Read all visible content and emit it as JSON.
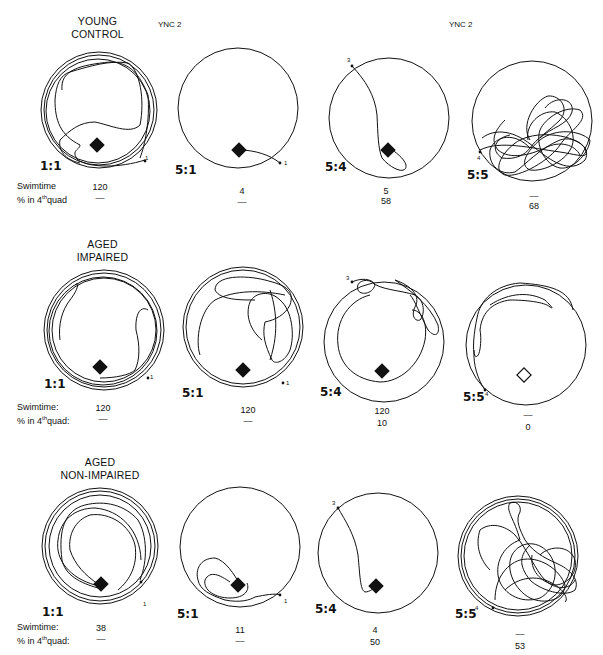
{
  "header": {
    "session_label_left": "YNC 2",
    "session_label_right": "YNC 2"
  },
  "row_labels": {
    "swimtime": "Swimtime",
    "quad": "% in 4th quad",
    "quad_prefix": "% in 4",
    "quad_sup": "th",
    "quad_suffix": "quad",
    "colon": ":"
  },
  "groups": [
    {
      "title_line1": "YOUNG",
      "title_line2": "CONTROL",
      "trials": [
        {
          "label": "1:1",
          "start_marker": "1",
          "swimtime": "120",
          "quad": "—"
        },
        {
          "label": "5:1",
          "start_marker": "1",
          "swimtime": "4",
          "quad": "—"
        },
        {
          "label": "5:4",
          "start_marker": "3",
          "swimtime": "5",
          "quad": "58"
        },
        {
          "label": "5:5",
          "start_marker": "4",
          "swimtime": "—",
          "quad": "68"
        }
      ]
    },
    {
      "title_line1": "AGED",
      "title_line2": "IMPAIRED",
      "trials": [
        {
          "label": "1:1",
          "start_marker": "1",
          "swimtime": "120",
          "quad": "—"
        },
        {
          "label": "5:1",
          "start_marker": "1",
          "swimtime": "120",
          "quad": "—"
        },
        {
          "label": "5:4",
          "start_marker": "3",
          "swimtime": "120",
          "quad": "10"
        },
        {
          "label": "5:5",
          "start_marker": "4",
          "swimtime": "—",
          "quad": "0"
        }
      ]
    },
    {
      "title_line1": "AGED",
      "title_line2": "NON-IMPAIRED",
      "trials": [
        {
          "label": "1:1",
          "start_marker": "1",
          "swimtime": "38",
          "quad": "—"
        },
        {
          "label": "5:1",
          "start_marker": "1",
          "swimtime": "11",
          "quad": "—"
        },
        {
          "label": "5:4",
          "start_marker": "3",
          "swimtime": "4",
          "quad": "50"
        },
        {
          "label": "5:5",
          "start_marker": "4",
          "swimtime": "—",
          "quad": "53"
        }
      ]
    }
  ],
  "icons": {
    "platform_filled": "filled-diamond",
    "platform_absent": "open-diamond"
  }
}
